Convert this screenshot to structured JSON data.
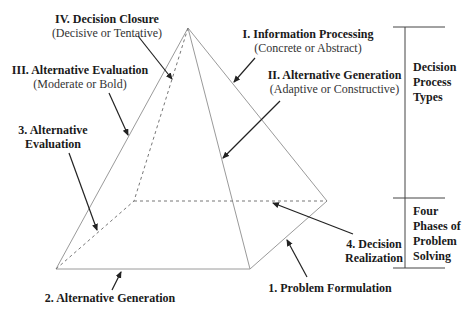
{
  "diagram": {
    "type": "pyramid",
    "decision_process_types": [
      {
        "id": "I",
        "title": "I. Information Processing",
        "subtitle": "(Concrete or Abstract)"
      },
      {
        "id": "II",
        "title": "II. Alternative Generation",
        "subtitle": "(Adaptive or Constructive)"
      },
      {
        "id": "III",
        "title": "III. Alternative Evaluation",
        "subtitle": "(Moderate or Bold)"
      },
      {
        "id": "IV",
        "title": "IV. Decision Closure",
        "subtitle": "(Decisive or Tentative)"
      }
    ],
    "problem_solving_phases": [
      {
        "id": "1",
        "title": "1. Problem Formulation"
      },
      {
        "id": "2",
        "title": "2. Alternative Generation"
      },
      {
        "id": "3",
        "title_line1": "3. Alternative",
        "title_line2": "Evaluation"
      },
      {
        "id": "4",
        "title_line1": "4. Decision",
        "title_line2": "Realization"
      }
    ],
    "bracket_labels": {
      "top": [
        "Decision",
        "Process",
        "Types"
      ],
      "bottom": [
        "Four",
        "Phases of",
        "Problem",
        "Solving"
      ]
    },
    "colors": {
      "edge": "#9a9a9a",
      "arrow": "#222222",
      "bracket": "#444444",
      "text": "#1a1a1a"
    }
  }
}
